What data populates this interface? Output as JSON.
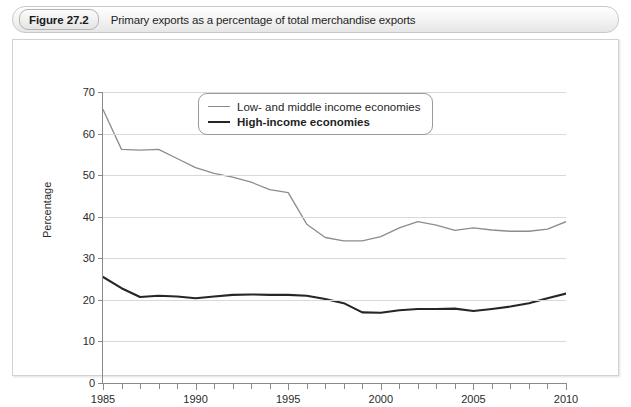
{
  "caption": {
    "figure_tag": "Figure 27.2",
    "title": "Primary exports as a percentage of total merchandise exports"
  },
  "chart_data": {
    "type": "line",
    "title": "Primary exports as a percentage of total merchandise exports",
    "xlabel": "",
    "ylabel": "Percentage",
    "xlim": [
      1985,
      2010
    ],
    "ylim": [
      0,
      70
    ],
    "ytick_step": 10,
    "yticks": [
      0,
      10,
      20,
      30,
      40,
      50,
      60,
      70
    ],
    "xticks_major": [
      1985,
      1990,
      1995,
      2000,
      2005,
      2010
    ],
    "xtick_step_minor": 1,
    "grid": "horizontal",
    "legend_position": "top-center",
    "x": [
      1985,
      1986,
      1987,
      1988,
      1989,
      1990,
      1991,
      1992,
      1993,
      1994,
      1995,
      1996,
      1997,
      1998,
      1999,
      2000,
      2001,
      2002,
      2003,
      2004,
      2005,
      2006,
      2007,
      2008,
      2009,
      2010
    ],
    "series": [
      {
        "name": "Low- and middle income economies",
        "color": "#8c8c8c",
        "width": 1.3,
        "values": [
          65.8,
          56.2,
          56.0,
          56.2,
          54.0,
          51.8,
          50.4,
          49.5,
          48.3,
          46.5,
          45.8,
          38.2,
          35.0,
          34.2,
          34.2,
          35.2,
          37.3,
          38.8,
          38.0,
          36.7,
          37.3,
          36.8,
          36.5,
          36.5,
          37.0,
          38.8
        ],
        "values_note": "upper curve; declines steeply 1985-1996, bottoms ~34 in 1993-95, recovers to ~41 by 2010"
      },
      {
        "name": "High-income economies",
        "color": "#262626",
        "width": 2.1,
        "values": [
          25.5,
          22.8,
          20.7,
          21.0,
          20.8,
          20.4,
          20.8,
          21.2,
          21.3,
          21.2,
          21.2,
          21.0,
          20.2,
          19.2,
          17.0,
          16.9,
          17.5,
          17.8,
          17.8,
          17.9,
          17.3,
          17.8,
          18.4,
          19.2,
          20.4,
          21.5
        ],
        "values_note": "lower curve; falls from ~25.5 in 1985 to ~17 by 1997, flat ~17-18, rises to ~23.5 by 2010"
      }
    ],
    "series_full": {
      "low_and_middle": [
        [
          1985,
          65.8
        ],
        [
          1986,
          56.2
        ],
        [
          1987,
          56.0
        ],
        [
          1988,
          56.2
        ],
        [
          1989,
          54.0
        ],
        [
          1990,
          51.8
        ],
        [
          1991,
          50.4
        ],
        [
          1992,
          49.5
        ],
        [
          1993,
          48.3
        ],
        [
          1994,
          46.5
        ],
        [
          1995,
          45.8
        ],
        [
          1996,
          38.2
        ],
        [
          1997,
          35.0
        ],
        [
          1998,
          34.2
        ],
        [
          1999,
          34.2
        ],
        [
          2000,
          35.2
        ],
        [
          2001,
          37.3
        ],
        [
          2002,
          38.8
        ],
        [
          2003,
          38.0
        ],
        [
          2004,
          36.7
        ],
        [
          2005,
          37.3
        ],
        [
          2006,
          36.8
        ],
        [
          2007,
          36.5
        ],
        [
          2008,
          36.5
        ],
        [
          2009,
          37.0
        ],
        [
          2010,
          38.8
        ]
      ],
      "high_income": [
        [
          1985,
          25.5
        ],
        [
          1986,
          22.8
        ],
        [
          1987,
          20.7
        ],
        [
          1988,
          21.0
        ],
        [
          1989,
          20.8
        ],
        [
          1990,
          20.4
        ],
        [
          1991,
          20.8
        ],
        [
          1992,
          21.2
        ],
        [
          1993,
          21.3
        ],
        [
          1994,
          21.2
        ],
        [
          1995,
          21.2
        ],
        [
          1996,
          21.0
        ],
        [
          1997,
          20.2
        ],
        [
          1998,
          19.2
        ],
        [
          1999,
          17.0
        ],
        [
          2000,
          16.9
        ],
        [
          2001,
          17.5
        ],
        [
          2002,
          17.8
        ],
        [
          2003,
          17.8
        ],
        [
          2004,
          17.9
        ],
        [
          2005,
          17.3
        ],
        [
          2006,
          17.8
        ],
        [
          2007,
          18.4
        ],
        [
          2008,
          19.2
        ],
        [
          2009,
          20.4
        ],
        [
          2010,
          21.5
        ]
      ]
    }
  },
  "legend": {
    "items": [
      {
        "label": "Low- and middle income economies",
        "style": "thin"
      },
      {
        "label": "High-income economies",
        "style": "thick"
      }
    ]
  }
}
